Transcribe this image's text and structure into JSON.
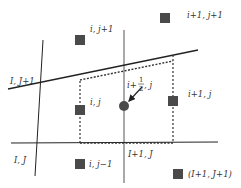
{
  "diagram": {
    "type": "staggered grid stencil",
    "colors": {
      "line": "#222222",
      "node": "#4a4a4a",
      "text": "#333333",
      "background": "#ffffff"
    },
    "labels": {
      "i_jp1": "i, j+1",
      "ip1_jp1": "i+1, j+1",
      "I_Jp1": "I, J+1",
      "i_j": "i, j",
      "ip1_j": "i+1, j",
      "ihalf_prefix": "i+",
      "ihalf_num": "1",
      "ihalf_den": "2",
      "ihalf_suffix": ", j",
      "I_J": "I, J",
      "Ip1_J": "I+1, J",
      "i_jm1": "i, j−1",
      "Ip1_Jp1": "(I+1, J+1)"
    }
  }
}
